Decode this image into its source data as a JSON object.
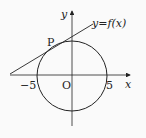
{
  "diagram": {
    "axes": {
      "x_label": "x",
      "y_label": "y",
      "origin_label": "O"
    },
    "circle": {
      "center": [
        0,
        0
      ],
      "radius": 5
    },
    "ticks": {
      "neg_x": "−5",
      "pos_x": "5"
    },
    "tangent": {
      "label": "y=f(x)",
      "point_label": "P"
    },
    "colors": {
      "stroke": "#222222",
      "background": "#fafafa"
    }
  }
}
